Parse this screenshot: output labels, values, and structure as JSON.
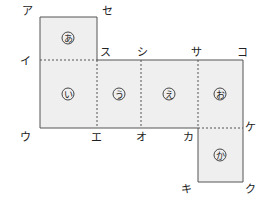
{
  "diagram": {
    "type": "cube-net",
    "faces": [
      {
        "id": "a",
        "label": "あ"
      },
      {
        "id": "i",
        "label": "い"
      },
      {
        "id": "u",
        "label": "う"
      },
      {
        "id": "e",
        "label": "え"
      },
      {
        "id": "o",
        "label": "お"
      },
      {
        "id": "ka",
        "label": "か"
      }
    ],
    "vertices": {
      "a": "ア",
      "se": "セ",
      "i": "イ",
      "su": "ス",
      "shi": "シ",
      "sa": "サ",
      "ko": "コ",
      "u": "ウ",
      "e": "エ",
      "o": "オ",
      "ka": "カ",
      "ke": "ケ",
      "ki": "キ",
      "ku": "ク"
    }
  }
}
